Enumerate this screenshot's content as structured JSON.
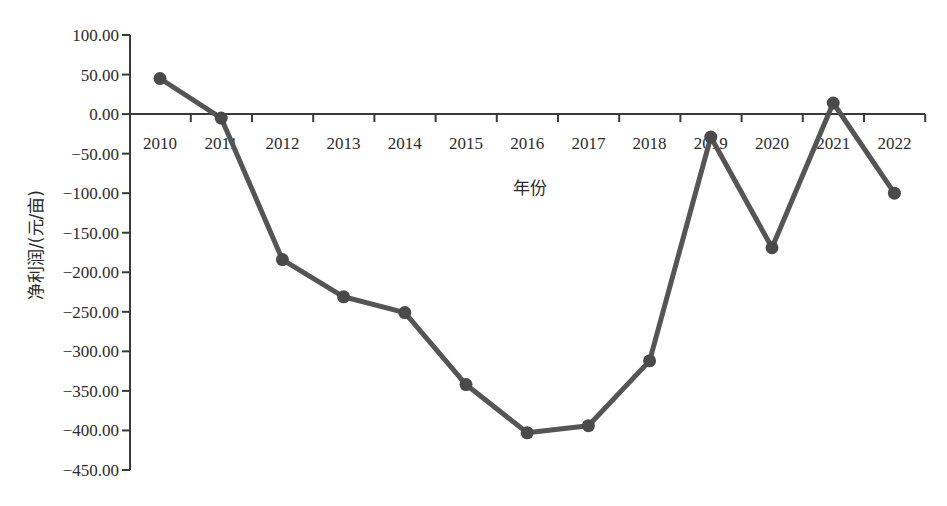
{
  "chart_data": {
    "type": "line",
    "title": "",
    "xlabel": "年份",
    "ylabel": "净利润/(元/亩)",
    "categories": [
      "2010",
      "2011",
      "2012",
      "2013",
      "2014",
      "2015",
      "2016",
      "2017",
      "2018",
      "2019",
      "2020",
      "2021",
      "2022"
    ],
    "series": [
      {
        "name": "净利润",
        "values": [
          45,
          -5,
          -184,
          -231,
          -251,
          -342,
          -403,
          -394,
          -312,
          -29,
          -169,
          14,
          -100
        ]
      }
    ],
    "ylim": [
      -450,
      100
    ],
    "yticks": [
      100,
      50,
      0,
      -50,
      -100,
      -150,
      -200,
      -250,
      -300,
      -350,
      -400,
      -450
    ],
    "ytick_labels": [
      "100.00",
      "50.00",
      "0.00",
      "-50.00",
      "-100.00",
      "-150.00",
      "-200.00",
      "-250.00",
      "-300.00",
      "-350.00",
      "-400.00",
      "-450.00"
    ],
    "grid": false,
    "legend": "none",
    "line_color": "#555555",
    "marker": "circle"
  }
}
